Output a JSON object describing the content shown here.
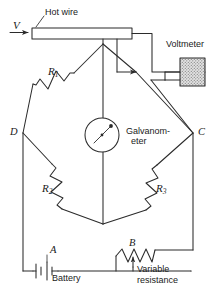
{
  "figure": {
    "type": "wheatstone-bridge-circuit-diagram",
    "background_color": "#ffffff",
    "line_color": "#2b2b2b",
    "fill_color": "#cccccc"
  },
  "labels": {
    "voltage_source": "V",
    "hot_wire": "Hot wire",
    "voltmeter": "Voltmeter",
    "galvanometer_line1": "Galvanom-",
    "galvanometer_line2": "eter",
    "resistor_1": "R",
    "resistor_1_sub": "1",
    "resistor_2": "R",
    "resistor_2_sub": "2",
    "resistor_3": "R",
    "resistor_3_sub": "3",
    "node_d": "D",
    "node_c": "C",
    "node_a": "A",
    "node_b": "B",
    "battery": "Battery",
    "variable_resistance_line1": "Variable",
    "variable_resistance_line2": "resistance"
  },
  "components": {
    "galvanometer": {
      "cx": 102,
      "cy": 135,
      "r": 17,
      "needle_angle_deg": -55
    },
    "voltmeter_box": {
      "x": 180,
      "y": 58,
      "w": 25,
      "h": 28
    },
    "hot_wire_bar": {
      "x": 32,
      "y": 28,
      "w": 100,
      "h": 11
    },
    "bridge_nodes": {
      "top": {
        "x": 103,
        "y": 44
      },
      "left_d": {
        "x": 23,
        "y": 133
      },
      "right_c": {
        "x": 193,
        "y": 133
      },
      "bottom": {
        "x": 103,
        "y": 224
      }
    }
  }
}
